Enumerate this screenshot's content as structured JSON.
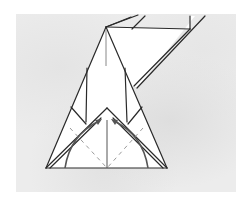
{
  "diagram": {
    "elements": [
      "folded paper model outline",
      "mountain/valley fold dashed lines",
      "curved fold arrows pointing to center crease",
      "center vertical crease"
    ],
    "colors": {
      "background_texture": "#ececec",
      "paper": "#ffffff",
      "line": "#2a2a2a",
      "dashed": "#9a9a9a",
      "arrow": "#555555"
    }
  }
}
